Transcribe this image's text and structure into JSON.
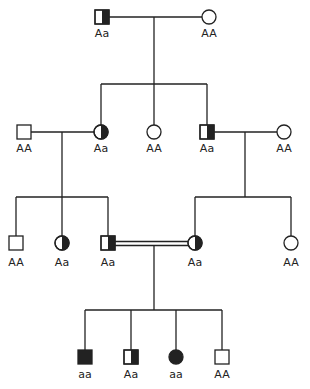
{
  "colors": {
    "line": "#222222",
    "affected": "#222222",
    "background": "#ffffff"
  },
  "legend_implicit": {
    "half_filled": "carrier (Aa)",
    "filled": "affected (aa)",
    "empty": "unaffected (AA)"
  },
  "generations": [
    {
      "id": "I",
      "individuals": [
        {
          "id": "I-1",
          "sex": "male",
          "status": "carrier",
          "genotype": "Aa"
        },
        {
          "id": "I-2",
          "sex": "female",
          "status": "unaffected",
          "genotype": "AA"
        }
      ]
    },
    {
      "id": "II",
      "individuals": [
        {
          "id": "II-1",
          "sex": "male",
          "status": "unaffected",
          "genotype": "AA"
        },
        {
          "id": "II-2",
          "sex": "female",
          "status": "carrier",
          "genotype": "Aa"
        },
        {
          "id": "II-3",
          "sex": "female",
          "status": "unaffected",
          "genotype": "AA"
        },
        {
          "id": "II-4",
          "sex": "male",
          "status": "carrier",
          "genotype": "Aa"
        },
        {
          "id": "II-5",
          "sex": "female",
          "status": "unaffected",
          "genotype": "AA"
        }
      ]
    },
    {
      "id": "III",
      "individuals": [
        {
          "id": "III-1",
          "sex": "male",
          "status": "unaffected",
          "genotype": "AA"
        },
        {
          "id": "III-2",
          "sex": "female",
          "status": "carrier",
          "genotype": "Aa"
        },
        {
          "id": "III-3",
          "sex": "male",
          "status": "carrier",
          "genotype": "Aa"
        },
        {
          "id": "III-4",
          "sex": "female",
          "status": "carrier",
          "genotype": "Aa"
        },
        {
          "id": "III-5",
          "sex": "female",
          "status": "unaffected",
          "genotype": "AA"
        }
      ]
    },
    {
      "id": "IV",
      "individuals": [
        {
          "id": "IV-1",
          "sex": "male",
          "status": "affected",
          "genotype": "aa"
        },
        {
          "id": "IV-2",
          "sex": "male",
          "status": "carrier",
          "genotype": "Aa"
        },
        {
          "id": "IV-3",
          "sex": "female",
          "status": "affected",
          "genotype": "aa"
        },
        {
          "id": "IV-4",
          "sex": "male",
          "status": "unaffected",
          "genotype": "AA"
        }
      ]
    }
  ],
  "matings": [
    {
      "partners": [
        "I-1",
        "I-2"
      ],
      "type": "normal"
    },
    {
      "partners": [
        "II-1",
        "II-2"
      ],
      "type": "normal"
    },
    {
      "partners": [
        "II-4",
        "II-5"
      ],
      "type": "normal"
    },
    {
      "partners": [
        "III-3",
        "III-4"
      ],
      "type": "consanguineous"
    }
  ]
}
